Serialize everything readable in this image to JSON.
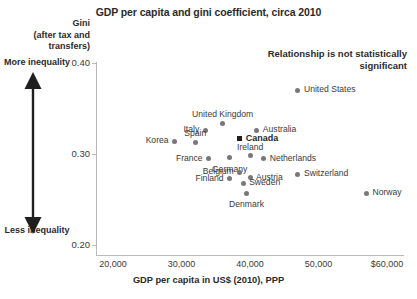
{
  "chart_data": {
    "type": "scatter",
    "title": "GDP per capita and gini coefficient, circa 2010",
    "xlabel": "GDP per capita in US$ (2010), PPP",
    "ylabel": "Gini (after tax and transfers)",
    "xlim": [
      16000,
      62000
    ],
    "ylim": [
      0.2,
      0.41
    ],
    "grid": false,
    "legend": "none",
    "annotation": "Relationship is not statistically significant",
    "xticks": [
      "20,000",
      "30,000",
      "40,000",
      "50,000",
      "$60,000"
    ],
    "xtick_values": [
      20000,
      30000,
      40000,
      50000,
      60000
    ],
    "yticks": [
      "0.40",
      "0.30",
      "0.20"
    ],
    "ytick_values": [
      0.4,
      0.3,
      0.2
    ],
    "axis_captions": {
      "y_header_line1": "Gini",
      "y_header_line2": "(after tax and",
      "y_header_line3": "transfers)",
      "more": "More inequality",
      "less": "Less inequality"
    },
    "points": [
      {
        "name": "United States",
        "x": 47000,
        "y": 0.37,
        "label_pos": "right",
        "highlight": false,
        "marker": "circle"
      },
      {
        "name": "United Kingdom",
        "x": 36000,
        "y": 0.334,
        "label_pos": "above",
        "highlight": false,
        "marker": "circle"
      },
      {
        "name": "Italy",
        "x": 33500,
        "y": 0.326,
        "label_pos": "left",
        "highlight": false,
        "marker": "circle"
      },
      {
        "name": "Australia",
        "x": 41000,
        "y": 0.326,
        "label_pos": "right",
        "highlight": false,
        "marker": "circle"
      },
      {
        "name": "Korea",
        "x": 29000,
        "y": 0.314,
        "label_pos": "left",
        "highlight": false,
        "marker": "circle"
      },
      {
        "name": "Canada",
        "x": 38500,
        "y": 0.317,
        "label_pos": "right",
        "highlight": true,
        "marker": "square"
      },
      {
        "name": "Spain",
        "x": 32000,
        "y": 0.313,
        "label_pos": "above",
        "highlight": false,
        "marker": "circle"
      },
      {
        "name": "Ireland",
        "x": 40000,
        "y": 0.298,
        "label_pos": "above",
        "highlight": false,
        "marker": "circle"
      },
      {
        "name": "France",
        "x": 34000,
        "y": 0.295,
        "label_pos": "left",
        "highlight": false,
        "marker": "circle"
      },
      {
        "name": "Germany",
        "x": 37000,
        "y": 0.296,
        "label_pos": "below",
        "highlight": false,
        "marker": "circle"
      },
      {
        "name": "Netherlands",
        "x": 42000,
        "y": 0.295,
        "label_pos": "right",
        "highlight": false,
        "marker": "circle"
      },
      {
        "name": "Switzerland",
        "x": 47000,
        "y": 0.278,
        "label_pos": "right",
        "highlight": false,
        "marker": "circle"
      },
      {
        "name": "Belgium",
        "x": 38500,
        "y": 0.28,
        "label_pos": "left",
        "highlight": false,
        "marker": "circle"
      },
      {
        "name": "Finland",
        "x": 37000,
        "y": 0.273,
        "label_pos": "left",
        "highlight": false,
        "marker": "circle"
      },
      {
        "name": "Austria",
        "x": 40000,
        "y": 0.274,
        "label_pos": "right",
        "highlight": false,
        "marker": "circle"
      },
      {
        "name": "Sweden",
        "x": 39000,
        "y": 0.268,
        "label_pos": "right",
        "highlight": false,
        "marker": "circle"
      },
      {
        "name": "Denmark",
        "x": 39500,
        "y": 0.257,
        "label_pos": "below",
        "highlight": false,
        "marker": "circle"
      },
      {
        "name": "Norway",
        "x": 57000,
        "y": 0.257,
        "label_pos": "right",
        "highlight": false,
        "marker": "circle"
      }
    ]
  },
  "colors": {
    "marker": "#787878",
    "marker_highlight": "#1f1f1f",
    "text": "#3a3a3a",
    "axis": "#b9b9b9"
  }
}
